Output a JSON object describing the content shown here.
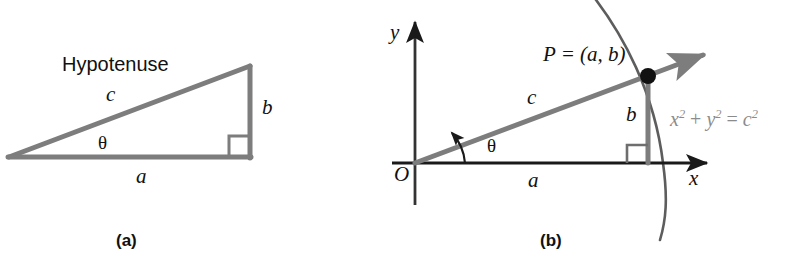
{
  "figure": {
    "background_color": "#ffffff",
    "stroke_gray": "#7d7d7d",
    "stroke_dark": "#1a1a1a",
    "equation_color": "#8b8b8b",
    "panels": [
      {
        "id": "a",
        "caption": "(a)",
        "title_label": "Hypotenuse",
        "labels": {
          "hypotenuse_side": "c",
          "opposite_side": "b",
          "adjacent_side": "a",
          "angle": "θ"
        }
      },
      {
        "id": "b",
        "caption": "(b)",
        "labels": {
          "y_axis": "y",
          "x_axis": "x",
          "origin": "O",
          "point": "P = (a, b)",
          "hypotenuse_side": "c",
          "opposite_side": "b",
          "adjacent_side": "a",
          "angle": "θ",
          "circle_equation_base": "x",
          "circle_equation_full": "x2 + y2 = c2",
          "circle_equation_parts": {
            "x": "x",
            "exp2_first": "2",
            "plus": " + ",
            "y": "y",
            "exp2_second": "2",
            "equals": " = ",
            "c": "c",
            "exp2_third": "2"
          }
        }
      }
    ]
  }
}
